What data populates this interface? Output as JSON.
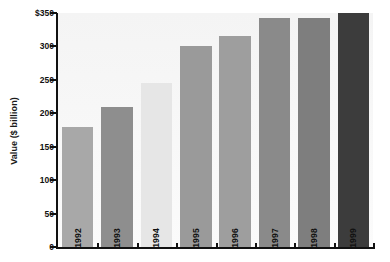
{
  "chart_data": {
    "type": "bar",
    "title": "",
    "xlabel": "",
    "ylabel": "Value ($ billion)",
    "categories": [
      "1992",
      "1993",
      "1994",
      "1995",
      "1996",
      "1997",
      "1998",
      "1999"
    ],
    "values": [
      180,
      210,
      245,
      300,
      315,
      342,
      342,
      350
    ],
    "ylim": [
      0,
      350
    ],
    "y_ticks": [
      0,
      50,
      100,
      150,
      200,
      250,
      300,
      350
    ],
    "y_tick_labels": [
      "0",
      "50",
      "100",
      "150",
      "200",
      "250",
      "300",
      "$350"
    ],
    "grid": false,
    "legend": "none",
    "bar_colors": [
      "#a8a8a8",
      "#8e8e8e",
      "#e6e6e6",
      "#9a9a9a",
      "#9e9e9e",
      "#8a8a8a",
      "#7e7e7e",
      "#3c3c3c"
    ],
    "label_position": "inside-bottom",
    "label_rotation": -90,
    "plot_background": "#f7f7f7",
    "axis_color": "#111111"
  },
  "axis": {
    "y_title": "Value ($ billion)"
  }
}
